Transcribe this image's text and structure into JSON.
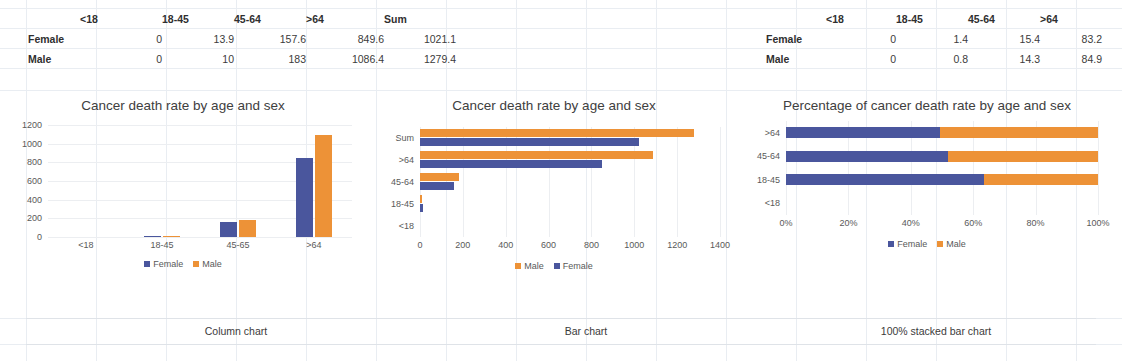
{
  "colors": {
    "female": "#4A569D",
    "male": "#ED9237",
    "grid": "#ECEEF1",
    "text": "#595959",
    "sheet_grid": "#E9EDF2"
  },
  "table_left": {
    "name": "cancer-death-rate-table",
    "corner": "",
    "headers": [
      "<18",
      "18-45",
      "45-64",
      ">64",
      "Sum"
    ],
    "rows": [
      {
        "label": "Female",
        "values": [
          "0",
          "13.9",
          "157.6",
          "849.6",
          "1021.1"
        ]
      },
      {
        "label": "Male",
        "values": [
          "0",
          "10",
          "183",
          "1086.4",
          "1279.4"
        ]
      }
    ]
  },
  "table_right": {
    "name": "cancer-death-rate-percentage-table",
    "corner": "",
    "headers": [
      "<18",
      "18-45",
      "45-64",
      ">64"
    ],
    "rows": [
      {
        "label": "Female",
        "values": [
          "0",
          "1.4",
          "15.4",
          "83.2"
        ]
      },
      {
        "label": "Male",
        "values": [
          "0",
          "0.8",
          "14.3",
          "84.9"
        ]
      }
    ]
  },
  "captions": {
    "column": "Column chart",
    "bar": "Bar chart",
    "stacked": "100% stacked bar chart"
  },
  "chart_data": [
    {
      "id": "column",
      "type": "bar",
      "orientation": "vertical",
      "title": "Cancer death rate by age and sex",
      "categories": [
        "<18",
        "18-45",
        "45-65",
        ">64"
      ],
      "series": [
        {
          "name": "Female",
          "color": "#4A569D",
          "values": [
            0,
            13.9,
            157.6,
            849.6
          ]
        },
        {
          "name": "Male",
          "color": "#ED9237",
          "values": [
            0,
            10,
            183,
            1086.4
          ]
        }
      ],
      "yticks": [
        1200,
        1000,
        800,
        600,
        400,
        200,
        0
      ],
      "ylim": [
        0,
        1200
      ],
      "xlabel": "",
      "ylabel": "",
      "grid": true,
      "legend": [
        "Female",
        "Male"
      ],
      "legend_position": "bottom"
    },
    {
      "id": "bar",
      "type": "bar",
      "orientation": "horizontal",
      "title": "Cancer death rate by age and sex",
      "categories": [
        "<18",
        "18-45",
        "45-64",
        ">64",
        "Sum"
      ],
      "series": [
        {
          "name": "Male",
          "color": "#ED9237",
          "values": [
            0,
            10,
            183,
            1086.4,
            1279.4
          ]
        },
        {
          "name": "Female",
          "color": "#4A569D",
          "values": [
            0,
            13.9,
            157.6,
            849.6,
            1021.1
          ]
        }
      ],
      "xticks": [
        0,
        200,
        400,
        600,
        800,
        1000,
        1200,
        1400
      ],
      "xlim": [
        0,
        1400
      ],
      "xlabel": "",
      "ylabel": "",
      "grid": true,
      "legend": [
        "Male",
        "Female"
      ],
      "legend_position": "bottom"
    },
    {
      "id": "stacked",
      "type": "bar",
      "orientation": "horizontal-stacked-100",
      "title": "Percentage of cancer death rate by age and sex",
      "categories": [
        "<18",
        "18-45",
        "45-64",
        ">64"
      ],
      "series": [
        {
          "name": "Female",
          "color": "#4A569D",
          "values": [
            0,
            63.5,
            52.0,
            49.5
          ]
        },
        {
          "name": "Male",
          "color": "#ED9237",
          "values": [
            0,
            36.5,
            48.0,
            50.5
          ]
        }
      ],
      "xticks": [
        "0%",
        "20%",
        "40%",
        "60%",
        "80%",
        "100%"
      ],
      "xlim": [
        0,
        100
      ],
      "xlabel": "",
      "ylabel": "",
      "grid": true,
      "legend": [
        "Female",
        "Male"
      ],
      "legend_position": "bottom"
    }
  ]
}
